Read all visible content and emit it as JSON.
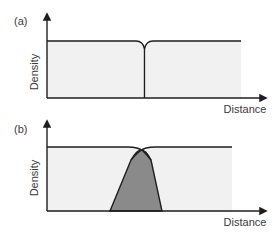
{
  "figure": {
    "panels": [
      {
        "id": "a",
        "label": "(a)",
        "y_axis_label": "Density",
        "x_axis_label": "Distance",
        "description": "Uniform density plateau with a narrow dip at the center"
      },
      {
        "id": "b",
        "label": "(b)",
        "y_axis_label": "Density",
        "x_axis_label": "Distance",
        "description": "Two overlapping density plateaus with a shaded overlap region"
      }
    ],
    "colors": {
      "line": "#1e1e1e",
      "fill_light": "#f1f1f1",
      "fill_overlap": "#8a8a8a",
      "text": "#3a3a3a"
    }
  }
}
